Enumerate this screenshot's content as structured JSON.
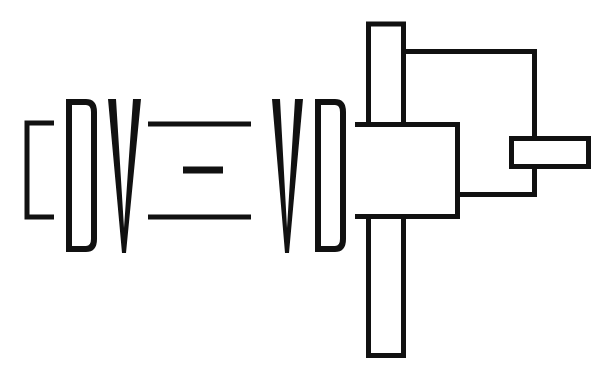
{
  "logo": {
    "text_left": "DV",
    "text_center": "=",
    "text_right": "VD",
    "colors": {
      "ink": "#111111",
      "background": "#ffffff"
    }
  },
  "diagram": {
    "elements": [
      "left-bracket",
      "letter-D-1",
      "letter-V-1",
      "equals-top-line",
      "equals-middle-dash",
      "equals-bottom-line",
      "letter-V-2",
      "letter-D-2",
      "horizontal-box",
      "vertical-bar",
      "feedback-line",
      "small-box"
    ]
  }
}
